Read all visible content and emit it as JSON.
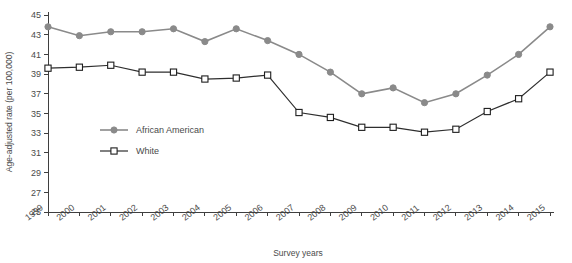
{
  "chart_data": {
    "type": "line",
    "title": "",
    "xlabel": "Survey years",
    "ylabel": "Age-adjusted rate (per 100,000)",
    "categories": [
      "1999",
      "2000",
      "2001",
      "2002",
      "2003",
      "2004",
      "2005",
      "2006",
      "2007",
      "2008",
      "2009",
      "2010",
      "2011",
      "2012",
      "2013",
      "2014",
      "2015"
    ],
    "x": [
      1999,
      2000,
      2001,
      2002,
      2003,
      2004,
      2005,
      2006,
      2007,
      2008,
      2009,
      2010,
      2011,
      2012,
      2013,
      2014,
      2015
    ],
    "series": [
      {
        "name": "African American",
        "marker": "filled-circle",
        "color": "#8a8a8a",
        "values": [
          43.8,
          42.9,
          43.3,
          43.3,
          43.6,
          42.3,
          43.6,
          42.4,
          41.0,
          39.2,
          37.0,
          37.6,
          36.1,
          37.0,
          38.9,
          41.0,
          43.8
        ]
      },
      {
        "name": "White",
        "marker": "open-square",
        "color": "#1e1e1e",
        "values": [
          39.6,
          39.7,
          39.9,
          39.2,
          39.2,
          38.5,
          38.6,
          38.9,
          35.1,
          34.6,
          33.6,
          33.6,
          33.1,
          33.4,
          35.2,
          36.5,
          39.2
        ]
      }
    ],
    "ylim": [
      25,
      45
    ],
    "yticks": [
      25,
      27,
      29,
      31,
      33,
      35,
      37,
      39,
      41,
      43,
      45
    ],
    "grid": false,
    "legend_position": "inside-left"
  },
  "legend": {
    "items": [
      {
        "label": "African American"
      },
      {
        "label": "White"
      }
    ]
  },
  "axes": {
    "y_title": "Age-adjusted rate (per 100,000)",
    "x_title": "Survey years"
  }
}
